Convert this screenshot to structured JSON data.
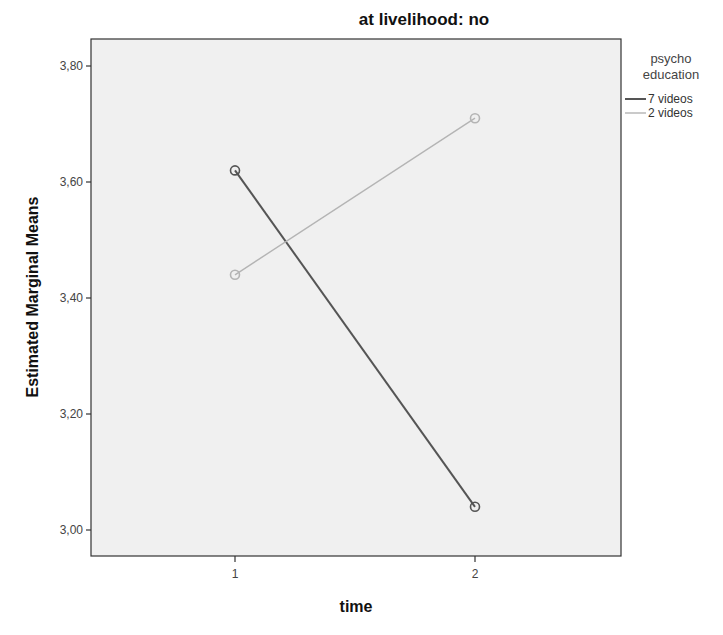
{
  "chart_data": {
    "type": "line",
    "title": "at livelihood: no",
    "xlabel": "time",
    "ylabel": "Estimated Marginal Means",
    "categories": [
      "1",
      "2"
    ],
    "x": [
      1,
      2
    ],
    "series": [
      {
        "name": "7 videos",
        "values": [
          3.62,
          3.04
        ],
        "color": "#555555"
      },
      {
        "name": "2 videos",
        "values": [
          3.44,
          3.71
        ],
        "color": "#b4b4b4"
      }
    ],
    "ylim": [
      2.95,
      3.845
    ],
    "yticks": [
      3.0,
      3.2,
      3.4,
      3.6,
      3.8
    ],
    "ytick_labels": [
      "3,00",
      "3,20",
      "3,40",
      "3,60",
      "3,80"
    ],
    "xticks": [
      "1",
      "2"
    ],
    "legend": {
      "title": "psycho education",
      "title_lines": [
        "psycho",
        "education"
      ],
      "position": "right",
      "entries": [
        "7 videos",
        "2 videos"
      ]
    },
    "grid": false,
    "markers": "open-circle"
  },
  "colors": {
    "plot_background": "#f0f0f0",
    "axis": "#333333"
  }
}
